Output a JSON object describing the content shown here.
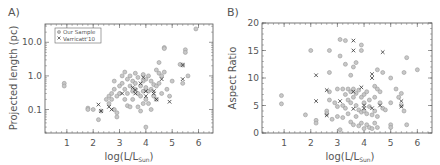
{
  "figure": {
    "panels": [
      {
        "label": "A)",
        "xlabel": "log(L/L",
        "xlabel_sub": "Sun",
        "xlabel_close": ")",
        "ylabel": "Projected length (pc)"
      },
      {
        "label": "B)",
        "xlabel": "log(L/L",
        "xlabel_sub": "Sun",
        "xlabel_close": ")",
        "ylabel": "Aspect Ratio"
      }
    ],
    "legend": {
      "items": [
        {
          "label": "Our Sample",
          "marker": "circle"
        },
        {
          "label": "Varricatt'10",
          "marker": "x"
        }
      ]
    },
    "colors": {
      "circle": "#999999",
      "x": "#333333",
      "axes": "#555555"
    }
  },
  "chart_data": [
    {
      "type": "scatter",
      "title": "A)",
      "xlabel": "log(L/L_Sun)",
      "ylabel": "Projected length (pc)",
      "xlim": [
        0.17,
        6.55
      ],
      "ylim": [
        0.02,
        35
      ],
      "yscale": "log",
      "xticks": [
        1,
        2,
        3,
        4,
        5,
        6
      ],
      "yticks": [
        {
          "v": 0.1,
          "label": "0.1"
        },
        {
          "v": 1.0,
          "label": "1.0"
        },
        {
          "v": 10.0,
          "label": "10.0"
        }
      ],
      "legend_position": "upper left",
      "series": [
        {
          "name": "Our Sample",
          "marker": "circle",
          "points": [
            [
              0.9,
              0.6
            ],
            [
              0.9,
              0.5
            ],
            [
              1.8,
              0.11
            ],
            [
              1.8,
              0.1
            ],
            [
              2.0,
              0.1
            ],
            [
              2.2,
              0.05
            ],
            [
              2.3,
              0.09
            ],
            [
              2.5,
              0.2
            ],
            [
              2.6,
              0.25
            ],
            [
              2.6,
              0.15
            ],
            [
              2.7,
              0.3
            ],
            [
              2.7,
              0.2
            ],
            [
              2.8,
              0.4
            ],
            [
              2.8,
              0.7
            ],
            [
              2.8,
              0.1
            ],
            [
              2.9,
              0.06
            ],
            [
              2.9,
              0.08
            ],
            [
              2.9,
              0.25
            ],
            [
              3.0,
              0.3
            ],
            [
              3.0,
              0.5
            ],
            [
              3.1,
              0.6
            ],
            [
              3.1,
              1.0
            ],
            [
              3.2,
              1.3
            ],
            [
              3.2,
              0.4
            ],
            [
              3.2,
              0.2
            ],
            [
              3.3,
              0.8
            ],
            [
              3.3,
              0.3
            ],
            [
              3.3,
              0.13
            ],
            [
              3.4,
              1.0
            ],
            [
              3.4,
              0.5
            ],
            [
              3.4,
              0.12
            ],
            [
              3.5,
              0.7
            ],
            [
              3.5,
              0.35
            ],
            [
              3.5,
              0.2
            ],
            [
              3.6,
              1.2
            ],
            [
              3.6,
              0.6
            ],
            [
              3.6,
              0.4
            ],
            [
              3.7,
              0.9
            ],
            [
              3.7,
              0.3
            ],
            [
              3.7,
              0.12
            ],
            [
              3.8,
              0.5
            ],
            [
              3.8,
              0.25
            ],
            [
              3.8,
              0.09
            ],
            [
              3.9,
              1.1
            ],
            [
              3.9,
              0.7
            ],
            [
              3.9,
              0.35
            ],
            [
              3.9,
              0.15
            ],
            [
              4.0,
              0.8
            ],
            [
              4.0,
              0.45
            ],
            [
              4.0,
              0.2
            ],
            [
              4.0,
              0.03
            ],
            [
              4.1,
              1.0
            ],
            [
              4.1,
              0.35
            ],
            [
              4.1,
              0.15
            ],
            [
              4.2,
              0.7
            ],
            [
              4.2,
              0.4
            ],
            [
              4.2,
              0.1
            ],
            [
              4.3,
              0.55
            ],
            [
              4.3,
              0.25
            ],
            [
              4.4,
              1.5
            ],
            [
              4.4,
              0.5
            ],
            [
              4.4,
              0.2
            ],
            [
              4.5,
              2.5
            ],
            [
              4.5,
              1.2
            ],
            [
              4.5,
              0.6
            ],
            [
              4.6,
              1.0
            ],
            [
              4.6,
              0.3
            ],
            [
              4.7,
              7.0
            ],
            [
              4.7,
              6.5
            ],
            [
              4.7,
              1.3
            ],
            [
              4.8,
              0.4
            ],
            [
              4.9,
              0.25
            ],
            [
              5.0,
              0.7
            ],
            [
              5.3,
              2.2
            ],
            [
              5.4,
              2.1
            ],
            [
              5.4,
              0.6
            ],
            [
              5.5,
              6.0
            ],
            [
              5.5,
              5.0
            ],
            [
              5.6,
              1.0
            ],
            [
              5.9,
              25.0
            ]
          ]
        },
        {
          "name": "Varricatt'10",
          "marker": "x",
          "points": [
            [
              2.2,
              0.14
            ],
            [
              2.3,
              0.09
            ],
            [
              2.6,
              0.12
            ],
            [
              2.7,
              0.1
            ],
            [
              3.1,
              0.3
            ],
            [
              3.5,
              0.45
            ],
            [
              3.6,
              0.38
            ],
            [
              3.6,
              0.3
            ],
            [
              3.8,
              0.6
            ],
            [
              3.9,
              0.9
            ],
            [
              4.0,
              0.35
            ],
            [
              4.0,
              0.25
            ],
            [
              4.3,
              0.35
            ],
            [
              4.3,
              0.3
            ],
            [
              4.4,
              0.2
            ],
            [
              4.6,
              0.8
            ],
            [
              4.9,
              0.17
            ],
            [
              5.4,
              0.8
            ],
            [
              5.4,
              2.1
            ]
          ]
        }
      ]
    },
    {
      "type": "scatter",
      "title": "B)",
      "xlabel": "log(L/L_Sun)",
      "ylabel": "Aspect Ratio",
      "xlim": [
        0.17,
        6.55
      ],
      "ylim": [
        0,
        20
      ],
      "xticks": [
        1,
        2,
        3,
        4,
        5,
        6
      ],
      "yticks": [
        0,
        5,
        10,
        15,
        20
      ],
      "series": [
        {
          "name": "Our Sample",
          "marker": "circle",
          "points": [
            [
              0.9,
              6.8
            ],
            [
              0.9,
              5.3
            ],
            [
              1.8,
              3.3
            ],
            [
              2.0,
              15.0
            ],
            [
              2.2,
              2.3
            ],
            [
              2.2,
              1.8
            ],
            [
              2.6,
              4.0
            ],
            [
              2.6,
              3.5
            ],
            [
              2.7,
              15.0
            ],
            [
              2.7,
              11.0
            ],
            [
              2.7,
              7.5
            ],
            [
              2.7,
              6.0
            ],
            [
              2.8,
              2.5
            ],
            [
              2.9,
              5.5
            ],
            [
              3.0,
              8.0
            ],
            [
              3.0,
              4.8
            ],
            [
              3.0,
              3.0
            ],
            [
              3.1,
              17.0
            ],
            [
              3.1,
              14.0
            ],
            [
              3.1,
              0.6
            ],
            [
              3.2,
              8.0
            ],
            [
              3.2,
              5.0
            ],
            [
              3.2,
              2.8
            ],
            [
              3.3,
              16.8
            ],
            [
              3.3,
              12.5
            ],
            [
              3.3,
              7.0
            ],
            [
              3.3,
              4.5
            ],
            [
              3.4,
              8.0
            ],
            [
              3.4,
              6.0
            ],
            [
              3.4,
              3.5
            ],
            [
              3.5,
              10.5
            ],
            [
              3.5,
              7.5
            ],
            [
              3.5,
              5.5
            ],
            [
              3.5,
              2.0
            ],
            [
              3.6,
              12.0
            ],
            [
              3.6,
              8.0
            ],
            [
              3.6,
              6.5
            ],
            [
              3.6,
              1.5
            ],
            [
              3.7,
              12.8
            ],
            [
              3.7,
              7.2
            ],
            [
              3.7,
              5.0
            ],
            [
              3.7,
              3.0
            ],
            [
              3.8,
              7.8
            ],
            [
              3.8,
              4.2
            ],
            [
              3.8,
              1.3
            ],
            [
              3.9,
              16.0
            ],
            [
              3.9,
              15.0
            ],
            [
              3.9,
              6.5
            ],
            [
              3.9,
              3.8
            ],
            [
              3.9,
              1.8
            ],
            [
              4.0,
              7.0
            ],
            [
              4.0,
              5.5
            ],
            [
              4.0,
              4.0
            ],
            [
              4.0,
              0.8
            ],
            [
              4.1,
              7.5
            ],
            [
              4.1,
              3.5
            ],
            [
              4.1,
              1.5
            ],
            [
              4.2,
              6.0
            ],
            [
              4.2,
              4.8
            ],
            [
              4.2,
              1.0
            ],
            [
              4.3,
              3.3
            ],
            [
              4.3,
              0.8
            ],
            [
              4.4,
              8.5
            ],
            [
              4.4,
              6.5
            ],
            [
              4.4,
              4.0
            ],
            [
              4.4,
              1.8
            ],
            [
              4.5,
              11.5
            ],
            [
              4.5,
              8.0
            ],
            [
              4.5,
              3.0
            ],
            [
              4.5,
              1.0
            ],
            [
              4.6,
              7.5
            ],
            [
              4.6,
              5.5
            ],
            [
              4.7,
              11.0
            ],
            [
              4.7,
              4.5
            ],
            [
              4.8,
              4.2
            ],
            [
              5.0,
              10.0
            ],
            [
              5.0,
              5.5
            ],
            [
              5.0,
              1.5
            ],
            [
              5.0,
              1.0
            ],
            [
              5.2,
              8.0
            ],
            [
              5.3,
              6.5
            ],
            [
              5.4,
              7.2
            ],
            [
              5.4,
              5.0
            ],
            [
              5.5,
              11.0
            ],
            [
              5.5,
              4.0
            ],
            [
              5.6,
              13.7
            ],
            [
              5.6,
              1.5
            ],
            [
              6.0,
              11.5
            ]
          ]
        },
        {
          "name": "Varricatt'10",
          "marker": "x",
          "points": [
            [
              2.2,
              10.5
            ],
            [
              2.2,
              5.8
            ],
            [
              2.6,
              7.8
            ],
            [
              2.6,
              3.2
            ],
            [
              3.1,
              5.8
            ],
            [
              3.6,
              16.8
            ],
            [
              3.6,
              15.0
            ],
            [
              3.6,
              7.5
            ],
            [
              3.6,
              4.4
            ],
            [
              3.9,
              8.3
            ],
            [
              4.0,
              5.0
            ],
            [
              4.0,
              4.5
            ],
            [
              4.3,
              10.7
            ],
            [
              4.3,
              10.0
            ],
            [
              4.3,
              4.5
            ],
            [
              4.6,
              5.0
            ],
            [
              4.7,
              14.7
            ],
            [
              5.4,
              5.8
            ],
            [
              5.4,
              4.8
            ]
          ]
        }
      ]
    }
  ]
}
